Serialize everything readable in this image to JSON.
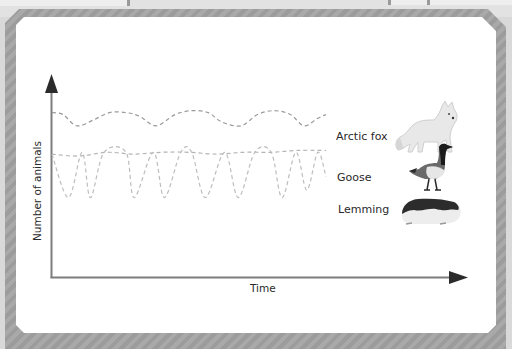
{
  "chart_data": {
    "type": "line",
    "title": "",
    "xlabel": "Time",
    "ylabel": "Number of animals",
    "grid": false,
    "x_ticks": [],
    "y_ticks": [],
    "xlim": [
      0,
      100
    ],
    "ylim": [
      0,
      100
    ],
    "legend_placement": "right",
    "line_style": "dashed",
    "series": [
      {
        "name": "Arctic fox",
        "color": "#9a9a9a",
        "x": [
          0,
          4,
          9,
          15,
          21,
          27,
          32,
          38,
          45,
          51,
          57,
          62,
          69,
          75,
          81,
          87,
          92,
          97,
          100
        ],
        "y": [
          87,
          86,
          80,
          83,
          87,
          87,
          85,
          80,
          86,
          88,
          87,
          82,
          80,
          86,
          88,
          86,
          80,
          84,
          86
        ]
      },
      {
        "name": "Goose",
        "color": "#b4b4b4",
        "x": [
          0,
          10,
          20,
          30,
          40,
          50,
          60,
          70,
          80,
          90,
          100
        ],
        "y": [
          65,
          64,
          66,
          65,
          66,
          66,
          65,
          66,
          66,
          67,
          67
        ]
      },
      {
        "name": "Lemming",
        "color": "#bdbdbd",
        "x": [
          0,
          6,
          11,
          14,
          19,
          27,
          30,
          37,
          41,
          47,
          51,
          56,
          63,
          68,
          74,
          80,
          84,
          89,
          93,
          97,
          100
        ],
        "y": [
          65,
          42,
          66,
          42,
          66,
          66,
          42,
          66,
          42,
          66,
          66,
          42,
          66,
          42,
          66,
          66,
          42,
          66,
          46,
          66,
          53
        ]
      }
    ],
    "legend": [
      "Arctic fox",
      "Goose",
      "Lemming"
    ]
  },
  "labels": {
    "fox": "Arctic fox",
    "goose": "Goose",
    "lemming": "Lemming",
    "xaxis": "Time",
    "yaxis": "Number of animals"
  },
  "icons": {
    "fox": "arctic-fox-illustration",
    "goose": "canada-goose-illustration",
    "lemming": "lemming-illustration"
  }
}
